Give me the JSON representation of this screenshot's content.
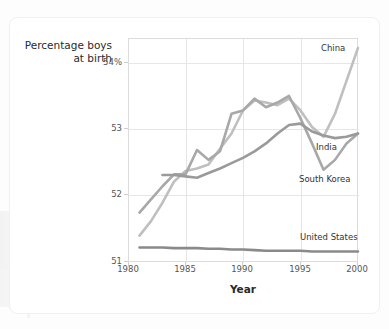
{
  "chart_data": {
    "type": "line",
    "title": "",
    "xlabel": "Year",
    "ylabel": "Percentage boys at birth",
    "ylabel_line1": "Percentage boys",
    "ylabel_line2": "at birth",
    "xlim": [
      1980,
      2000
    ],
    "ylim": [
      51,
      54.4
    ],
    "grid": true,
    "legend_position": "inline-right-labels",
    "xticks": [
      "1980",
      "1985",
      "1990",
      "1995",
      "2000"
    ],
    "xtick_values": [
      1980,
      1985,
      1990,
      1995,
      2000
    ],
    "yticks": [
      "54%",
      "53",
      "52",
      "51"
    ],
    "ytick_values": [
      54,
      53,
      52,
      51
    ],
    "x": [
      1980,
      1981,
      1982,
      1983,
      1984,
      1985,
      1986,
      1987,
      1988,
      1989,
      1990,
      1991,
      1992,
      1993,
      1994,
      1995,
      1996,
      1997,
      1998,
      1999,
      2000
    ],
    "series": [
      {
        "name": "China",
        "color": "#bfbfbf",
        "values": [
          null,
          51.4,
          51.62,
          51.9,
          52.22,
          52.38,
          52.42,
          52.48,
          52.72,
          52.95,
          53.3,
          53.45,
          53.42,
          53.38,
          53.48,
          53.3,
          53.05,
          52.9,
          53.25,
          53.75,
          54.25
        ]
      },
      {
        "name": "South Korea",
        "color": "#a8a8a8",
        "values": [
          null,
          51.75,
          51.95,
          52.15,
          52.33,
          52.33,
          52.7,
          52.55,
          52.68,
          53.25,
          53.3,
          53.48,
          53.35,
          53.42,
          53.52,
          53.18,
          52.8,
          52.4,
          52.55,
          52.8,
          52.95
        ]
      },
      {
        "name": "India",
        "color": "#9a9a9a",
        "values": [
          null,
          null,
          null,
          52.32,
          52.32,
          52.3,
          52.28,
          52.35,
          52.42,
          52.5,
          52.58,
          52.68,
          52.8,
          52.95,
          53.08,
          53.1,
          52.98,
          52.92,
          52.88,
          52.9,
          52.95
        ]
      },
      {
        "name": "United States",
        "color": "#8a8a8a",
        "values": [
          null,
          51.22,
          51.22,
          51.22,
          51.21,
          51.21,
          51.21,
          51.2,
          51.2,
          51.19,
          51.19,
          51.18,
          51.17,
          51.17,
          51.17,
          51.17,
          51.16,
          51.16,
          51.16,
          51.16,
          51.16
        ]
      }
    ],
    "series_labels": [
      {
        "name": "China",
        "text": "China"
      },
      {
        "name": "India",
        "text": "India"
      },
      {
        "name": "South Korea",
        "text": "South Korea"
      },
      {
        "name": "United States",
        "text": "United States"
      }
    ]
  }
}
